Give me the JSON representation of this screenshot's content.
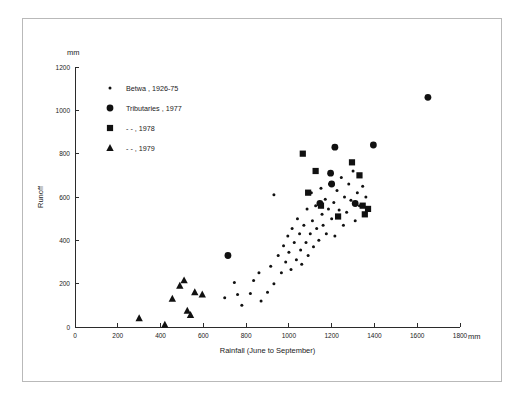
{
  "chart_data": {
    "type": "scatter",
    "title": "",
    "xlabel": "Rainfall (June to September)",
    "ylabel": "Runoff",
    "x_unit": "mm",
    "y_unit": "mm",
    "xlim": [
      0,
      1800
    ],
    "ylim": [
      0,
      1200
    ],
    "x_ticks": [
      0,
      200,
      400,
      600,
      800,
      1000,
      1200,
      1400,
      1600,
      1800
    ],
    "y_ticks": [
      0,
      200,
      400,
      600,
      800,
      1000,
      1200
    ],
    "grid": false,
    "legend_position": "upper-left inside axes",
    "series": [
      {
        "name": "Betwa, 1926-75",
        "marker": "small-dot",
        "color": "#111111",
        "points": [
          [
            700,
            135
          ],
          [
            760,
            150
          ],
          [
            745,
            205
          ],
          [
            780,
            100
          ],
          [
            820,
            155
          ],
          [
            835,
            215
          ],
          [
            870,
            120
          ],
          [
            860,
            250
          ],
          [
            900,
            160
          ],
          [
            915,
            280
          ],
          [
            930,
            200
          ],
          [
            930,
            610
          ],
          [
            950,
            330
          ],
          [
            965,
            250
          ],
          [
            975,
            375
          ],
          [
            985,
            300
          ],
          [
            995,
            420
          ],
          [
            1000,
            345
          ],
          [
            1010,
            265
          ],
          [
            1015,
            455
          ],
          [
            1025,
            390
          ],
          [
            1035,
            310
          ],
          [
            1040,
            500
          ],
          [
            1050,
            430
          ],
          [
            1055,
            355
          ],
          [
            1060,
            290
          ],
          [
            1070,
            470
          ],
          [
            1080,
            390
          ],
          [
            1085,
            545
          ],
          [
            1090,
            330
          ],
          [
            1100,
            430
          ],
          [
            1105,
            620
          ],
          [
            1110,
            490
          ],
          [
            1115,
            370
          ],
          [
            1125,
            560
          ],
          [
            1130,
            455
          ],
          [
            1140,
            400
          ],
          [
            1150,
            640
          ],
          [
            1155,
            520
          ],
          [
            1160,
            470
          ],
          [
            1170,
            590
          ],
          [
            1175,
            430
          ],
          [
            1185,
            545
          ],
          [
            1190,
            660
          ],
          [
            1200,
            500
          ],
          [
            1210,
            575
          ],
          [
            1215,
            420
          ],
          [
            1225,
            630
          ],
          [
            1235,
            540
          ],
          [
            1245,
            690
          ],
          [
            1255,
            470
          ],
          [
            1260,
            600
          ],
          [
            1270,
            530
          ],
          [
            1280,
            660
          ],
          [
            1290,
            585
          ],
          [
            1300,
            720
          ],
          [
            1310,
            490
          ],
          [
            1320,
            620
          ],
          [
            1330,
            560
          ],
          [
            1345,
            650
          ],
          [
            1360,
            600
          ],
          [
            1375,
            540
          ]
        ]
      },
      {
        "name": "Tributaries, 1977",
        "marker": "circle",
        "color": "#111111",
        "points": [
          [
            715,
            330
          ],
          [
            1145,
            570
          ],
          [
            1195,
            710
          ],
          [
            1200,
            660
          ],
          [
            1215,
            830
          ],
          [
            1310,
            570
          ],
          [
            1395,
            840
          ],
          [
            1650,
            1060
          ]
        ]
      },
      {
        "name": "Tributaries, 1978",
        "marker": "square",
        "color": "#111111",
        "points": [
          [
            1065,
            800
          ],
          [
            1125,
            720
          ],
          [
            1090,
            620
          ],
          [
            1150,
            560
          ],
          [
            1230,
            510
          ],
          [
            1295,
            760
          ],
          [
            1330,
            700
          ],
          [
            1345,
            560
          ],
          [
            1355,
            520
          ],
          [
            1370,
            545
          ]
        ]
      },
      {
        "name": "Tributaries, 1979",
        "marker": "triangle",
        "color": "#111111",
        "points": [
          [
            300,
            40
          ],
          [
            420,
            10
          ],
          [
            455,
            130
          ],
          [
            490,
            190
          ],
          [
            510,
            215
          ],
          [
            525,
            75
          ],
          [
            540,
            55
          ],
          [
            560,
            160
          ],
          [
            595,
            150
          ]
        ]
      }
    ]
  },
  "legend": {
    "entries": [
      {
        "marker": "small-dot",
        "label": "Betwa , 1926-75"
      },
      {
        "marker": "circle",
        "label": "Tributaries , 1977"
      },
      {
        "marker": "square",
        "label": "- -        , 1978"
      },
      {
        "marker": "triangle",
        "label": "- -        , 1979"
      }
    ]
  },
  "axes": {
    "y_unit_label": "mm",
    "x_unit_label": "mm",
    "y_title": "Runoff",
    "x_title": "Rainfall (June to September)"
  }
}
